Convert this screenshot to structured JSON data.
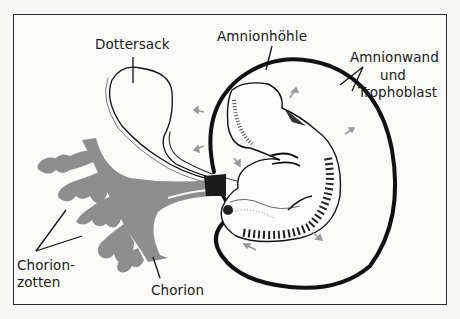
{
  "diagram": {
    "labels": {
      "dottersack": "Dottersack",
      "amnionhoehle": "Amnionhöhle",
      "amnionwand": "Amnionwand",
      "und": "und",
      "trophoblast": "Trophoblast",
      "chorionzotten_1": "Chorion-",
      "chorionzotten_2": "zotten",
      "chorion": "Chorion"
    },
    "colors": {
      "line": "#111111",
      "chorion_gray": "#8c8c8c",
      "background": "#fafaf8",
      "arrow_gray": "#9a9a9a"
    }
  }
}
